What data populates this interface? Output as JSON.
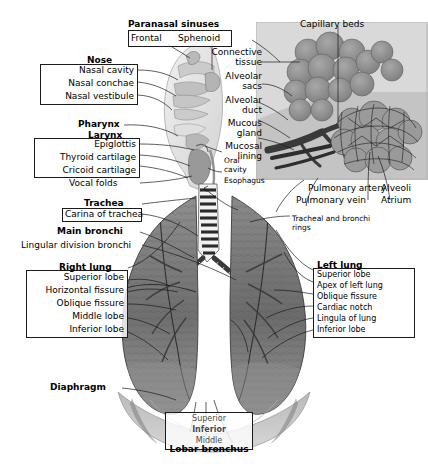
{
  "figure": {
    "background_color": "#ffffff",
    "line_color": "#1b1b1b",
    "width": 428,
    "height": 474
  },
  "groups": {
    "paranasal_sinuses": {
      "header": "Paranasal sinuses",
      "items": [
        "Frontal",
        "Sphenoid"
      ]
    },
    "nose": {
      "header": "Nose",
      "items": [
        "Nasal cavity",
        "Nasal conchae",
        "Nasal vestibule"
      ]
    },
    "larynx": {
      "header": "Larynx",
      "items": [
        "Epiglottis",
        "Thyroid cartilage",
        "Cricoid cartilage"
      ]
    },
    "trachea": {
      "header": "Trachea",
      "items": [
        "Carina of trachea"
      ]
    },
    "right_lung": {
      "header": "Right lung",
      "items": [
        "Superior lobe",
        "Horizontal fissure",
        "Oblique fissure",
        "Middle lobe",
        "Inferior lobe"
      ]
    },
    "left_lung": {
      "header": "Left lung",
      "items": [
        "Superior lobe",
        "Apex of left lung",
        "Oblique fissure",
        "Cardiac notch",
        "Lingula of lung",
        "Inferior lobe"
      ]
    },
    "lobar_bronchus": {
      "header": "Lobar bronchus",
      "items": [
        "Superior",
        "Inferior",
        "Middle"
      ]
    }
  },
  "labels": {
    "pharynx": "Pharynx",
    "vocal_folds": "Vocal folds",
    "main_bronchi": "Main bronchi",
    "lingular_division_bronchi": "Lingular division bronchi",
    "diaphragm": "Diaphragm",
    "oral_cavity_line1": "Oral",
    "oral_cavity_line2": "cavity",
    "esophagus": "Esophagus",
    "capillary_beds": "Capillary beds",
    "connective_tissue_line1": "Connective",
    "connective_tissue_line2": "tissue",
    "alveolar_sacs_line1": "Alveolar",
    "alveolar_sacs_line2": "sacs",
    "alveolar_duct_line1": "Alveolar",
    "alveolar_duct_line2": "duct",
    "mucous_gland_line1": "Mucous",
    "mucous_gland_line2": "gland",
    "mucosal_lining_line1": "Mucosal",
    "mucosal_lining_line2": "lining",
    "pulmonary_artery": "Pulmonary artery",
    "pulmonary_vein": "Pulmonary vein",
    "alveoli": "Alveoli",
    "atrium": "Atrium",
    "tracheal_rings_line1": "Tracheal and bronchi",
    "tracheal_rings_line2": "rings"
  }
}
